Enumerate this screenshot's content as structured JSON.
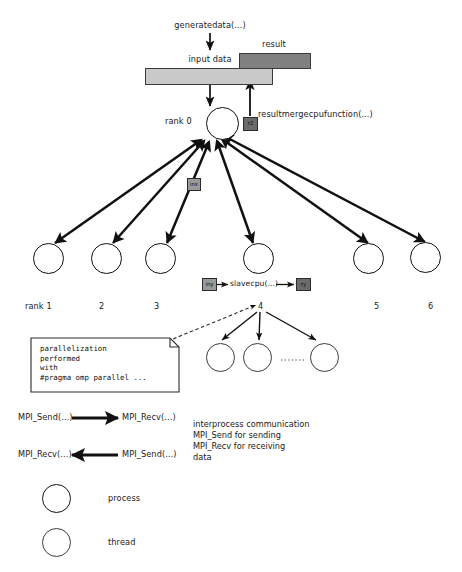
{
  "diagram": {
    "colors": {
      "input_bar_fill": "#c9c9c9",
      "result_bar_fill": "#808080",
      "tag_light_fill": "#9a9a9a",
      "tag_dark_fill": "#6b6b6b",
      "stroke": "#111111",
      "note_stroke": "#2b2b2b",
      "background": "#ffffff"
    }
  },
  "top": {
    "generate_label": "generatedata(...)",
    "input_bar_label": "input data",
    "result_bar_label": "result",
    "merge_label": "resultmergecpufunction(...)",
    "rank0_label": "rank 0",
    "rank0_tag": "r2"
  },
  "middle": {
    "send_tag": "inx",
    "slave_in_tag": "iny",
    "slave_function": "slavecpu(...)",
    "slave_out_tag": "ry"
  },
  "ranks": {
    "labels": [
      "rank 1",
      "2",
      "3",
      "4",
      "5",
      "6"
    ]
  },
  "note": {
    "lines": "parallelization\nperformed\nwith\n#pragma omp parallel ..."
  },
  "threads": {
    "ellipsis": "........"
  },
  "legend": {
    "comm_rows": [
      {
        "left": "MPI_Send(...)",
        "right": "MPI_Recv(...)",
        "direction": "right"
      },
      {
        "left": "MPI_Recv(...)",
        "right": "MPI_Send(...)",
        "direction": "left"
      }
    ],
    "comm_description": "interprocess communication\nMPI_Send for sending\nMPI_Recv for receiving\ndata",
    "symbol_rows": [
      {
        "shape": "process-circle",
        "label": "process"
      },
      {
        "shape": "thread-circle",
        "label": "thread"
      }
    ]
  }
}
